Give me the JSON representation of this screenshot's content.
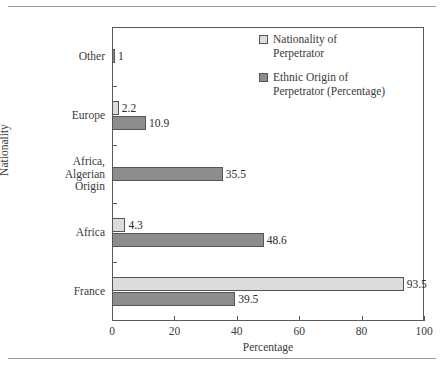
{
  "chart_data": {
    "type": "bar",
    "orientation": "horizontal",
    "title": "",
    "xlabel": "Percentage",
    "ylabel": "Nationality",
    "xlim": [
      0,
      100
    ],
    "xticks": [
      0,
      20,
      40,
      60,
      80,
      100
    ],
    "grid": false,
    "legend_position": "top-right",
    "categories": [
      "Other",
      "Europe",
      "Africa,\nAlgerian\nOrigin",
      "Africa",
      "France"
    ],
    "series": [
      {
        "name": "Nationality of\nPerpetrator",
        "color": "#dcdcdc",
        "values": [
          null,
          2.2,
          null,
          4.3,
          93.5
        ],
        "labels": [
          "",
          "2.2",
          "",
          "4.3",
          "93.5"
        ]
      },
      {
        "name": "Ethnic Origin of\nPerpetrator (Percentage)",
        "color": "#8d8d8d",
        "values": [
          1,
          10.9,
          35.5,
          48.6,
          39.5
        ],
        "labels": [
          "1",
          "10.9",
          "35.5",
          "48.6",
          "39.5"
        ]
      }
    ]
  },
  "legend": {
    "entries": [
      {
        "label": "Nationality of\nPerpetrator"
      },
      {
        "label": "Ethnic Origin of\nPerpetrator (Percentage)"
      }
    ]
  },
  "axes": {
    "x_title": "Percentage",
    "y_title": "Nationality",
    "x_tick_labels": [
      "0",
      "20",
      "40",
      "60",
      "80",
      "100"
    ]
  },
  "colors": {
    "series_light": "#dcdcdc",
    "series_dark": "#8d8d8d",
    "frame": "#5a5a5a",
    "rule": "#9a9a9a",
    "text": "#3a3a3a"
  }
}
